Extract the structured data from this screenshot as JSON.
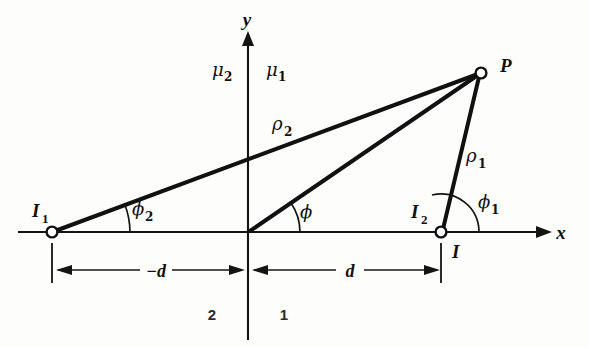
{
  "figure": {
    "background_color": "#fdfdfb",
    "ink_color": "#111111"
  },
  "axes": {
    "x_label": "x",
    "y_label": "y",
    "origin_label": ""
  },
  "media_labels": {
    "left_permeability": "μ",
    "left_permeability_sub": "2",
    "right_permeability": "μ",
    "right_permeability_sub": "1",
    "left_region": "2",
    "right_region": "1"
  },
  "points": [
    {
      "id": "I1",
      "label": "I",
      "sub": "1",
      "x": 52,
      "y": 232,
      "marker": "open-circle"
    },
    {
      "id": "I2",
      "label": "I",
      "sub": "2",
      "x": 441,
      "y": 232,
      "marker": "open-circle"
    },
    {
      "id": "P",
      "label": "P",
      "sub": "",
      "x": 481,
      "y": 73,
      "marker": "open-circle"
    },
    {
      "id": "I",
      "label": "I",
      "sub": "",
      "x": 441,
      "y": 232,
      "marker": "none"
    }
  ],
  "distances": [
    {
      "label": "−d",
      "value": "-d",
      "from_x": 52,
      "to_x": 248,
      "y": 270
    },
    {
      "label": "d",
      "value": "d",
      "from_x": 248,
      "to_x": 441,
      "y": 270
    }
  ],
  "rays": [
    {
      "name": "rho2",
      "label": "ρ",
      "sub": "2",
      "from": "I1",
      "to": "P",
      "label_x": 278,
      "label_y": 128
    },
    {
      "name": "rho1",
      "label": "ρ",
      "sub": "1",
      "from": "I2",
      "to": "P",
      "label_x": 471,
      "label_y": 160
    },
    {
      "name": "rho",
      "label": "",
      "sub": "",
      "from": "origin",
      "to": "P",
      "label_x": 0,
      "label_y": 0
    }
  ],
  "angles": [
    {
      "name": "phi2",
      "label": "ϕ",
      "sub": "2",
      "vertex": "I1",
      "label_x": 136,
      "label_y": 212
    },
    {
      "name": "phi",
      "label": "ϕ",
      "sub": "",
      "vertex": "origin",
      "label_x": 304,
      "label_y": 214
    },
    {
      "name": "phi1",
      "label": "ϕ",
      "sub": "1",
      "vertex": "I2",
      "label_x": 483,
      "label_y": 205
    }
  ]
}
